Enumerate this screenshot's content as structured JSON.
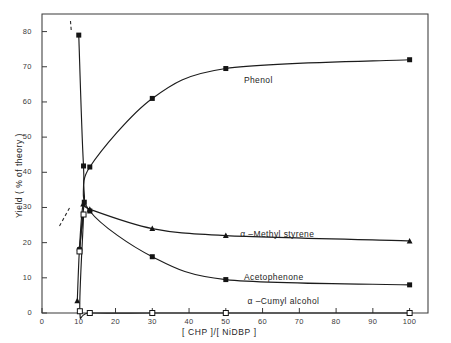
{
  "chart_data": {
    "type": "line",
    "title": "",
    "xlabel": "[ CHP ]/[ NiDBP ]",
    "ylabel": "Yield ( % of theory )",
    "xlim": [
      0,
      105
    ],
    "ylim": [
      0,
      85
    ],
    "xticks": [
      0,
      10,
      20,
      30,
      40,
      50,
      60,
      70,
      80,
      90,
      100
    ],
    "yticks": [
      0,
      10,
      20,
      30,
      40,
      50,
      60,
      70,
      80
    ],
    "xticklabels": [
      "0",
      "10",
      "20",
      "30",
      "40",
      "50",
      "60",
      "70",
      "80",
      "90",
      "100"
    ],
    "yticklabels": [
      "0",
      "10",
      "20",
      "30",
      "40",
      "50",
      "60",
      "70",
      "80"
    ],
    "grid": false,
    "legend_position": "inline-annotations",
    "series": [
      {
        "name": "Phenol",
        "marker": "filled-square",
        "label_x": 62,
        "label_y": 66,
        "points": [
          {
            "x": 10.2,
            "y": 18.0
          },
          {
            "x": 11.5,
            "y": 31.5
          },
          {
            "x": 13.0,
            "y": 41.5
          },
          {
            "x": 30.0,
            "y": 61.0
          },
          {
            "x": 50.0,
            "y": 69.5
          },
          {
            "x": 100.0,
            "y": 72.0
          }
        ]
      },
      {
        "name": "α –Methyl styrene",
        "marker": "filled-triangle",
        "label_x": 61,
        "label_y": 22.2,
        "points": [
          {
            "x": 9.6,
            "y": 3.5
          },
          {
            "x": 10.2,
            "y": 18.5
          },
          {
            "x": 11.2,
            "y": 31.0
          },
          {
            "x": 13.0,
            "y": 29.5
          },
          {
            "x": 30.0,
            "y": 24.0
          },
          {
            "x": 50.0,
            "y": 22.0
          },
          {
            "x": 100.0,
            "y": 20.5
          }
        ]
      },
      {
        "name": "Acetophenone",
        "marker": "filled-square",
        "label_x": 62,
        "label_y": 10.0,
        "points": [
          {
            "x": 10.0,
            "y": 79.0
          },
          {
            "x": 11.3,
            "y": 41.8
          },
          {
            "x": 13.0,
            "y": 29.0
          },
          {
            "x": 30.0,
            "y": 16.0
          },
          {
            "x": 50.0,
            "y": 9.5
          },
          {
            "x": 100.0,
            "y": 8.0
          }
        ]
      },
      {
        "name": "α –Cumyl  alcohol",
        "marker": "open-square",
        "label_x": 63,
        "label_y": 3.2,
        "points": [
          {
            "x": 10.2,
            "y": 17.5
          },
          {
            "x": 11.3,
            "y": 28.0
          },
          {
            "x": 10.3,
            "y": 0.5
          },
          {
            "x": 13.0,
            "y": 0.0
          },
          {
            "x": 30.0,
            "y": 0.0
          },
          {
            "x": 50.0,
            "y": 0.0
          },
          {
            "x": 100.0,
            "y": 0.0
          }
        ]
      }
    ]
  }
}
